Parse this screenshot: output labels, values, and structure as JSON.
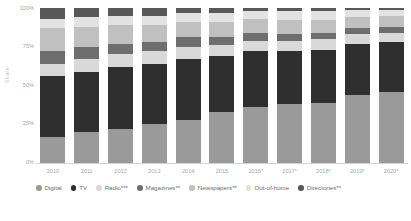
{
  "chart_data": {
    "type": "bar",
    "subtype": "stacked-percentage",
    "title": "",
    "xlabel": "",
    "ylabel": "Share",
    "ylim": [
      0,
      100
    ],
    "ytick_labels": [
      "100%",
      "75%",
      "50%",
      "25%",
      "0%"
    ],
    "ytick_values": [
      100,
      75,
      50,
      25,
      0
    ],
    "grid": false,
    "legend_position": "bottom",
    "categories": [
      "2010",
      "2011",
      "2012",
      "2013",
      "2014",
      "2015",
      "2016*",
      "2017*",
      "2018*",
      "2019*",
      "2020*"
    ],
    "stack_order_bottom_to_top": [
      "Digital",
      "TV",
      "Radio***",
      "Magazines**",
      "Newspapers**",
      "Out-of-home",
      "Directories**"
    ],
    "series": [
      {
        "name": "Digital",
        "color": "#9a9a9a",
        "values": [
          17,
          20,
          22,
          25,
          28,
          33,
          36,
          38,
          39,
          44,
          46
        ]
      },
      {
        "name": "TV",
        "color": "#2f2f2f",
        "values": [
          39,
          39,
          40,
          39,
          39,
          36,
          36,
          34,
          34,
          33,
          32
        ]
      },
      {
        "name": "Radio***",
        "color": "#d9d9d9",
        "values": [
          8,
          8,
          8,
          8,
          8,
          7,
          7,
          7,
          7,
          6,
          6
        ]
      },
      {
        "name": "Magazines**",
        "color": "#6e6e6e",
        "values": [
          8,
          8,
          7,
          6,
          6,
          5,
          5,
          4,
          4,
          4,
          4
        ]
      },
      {
        "name": "Newspapers**",
        "color": "#c0c0c0",
        "values": [
          15,
          13,
          12,
          11,
          10,
          10,
          9,
          9,
          8,
          7,
          7
        ]
      },
      {
        "name": "Out-of-home",
        "color": "#e2e2e2",
        "values": [
          6,
          6,
          6,
          6,
          6,
          6,
          5,
          6,
          6,
          5,
          4
        ]
      },
      {
        "name": "Directories**",
        "color": "#585858",
        "values": [
          7,
          6,
          5,
          5,
          3,
          3,
          2,
          2,
          2,
          1,
          1
        ]
      }
    ]
  },
  "legend": {
    "items": [
      {
        "label": "Digital",
        "color": "#9a9a9a"
      },
      {
        "label": "TV",
        "color": "#2f2f2f"
      },
      {
        "label": "Radio***",
        "color": "#d9d9d9"
      },
      {
        "label": "Magazines**",
        "color": "#6e6e6e"
      },
      {
        "label": "Newspapers**",
        "color": "#c0c0c0"
      },
      {
        "label": "Out-of-home",
        "color": "#e2e2e2"
      },
      {
        "label": "Directories**",
        "color": "#585858"
      }
    ]
  },
  "axes": {
    "y_title": "Share",
    "y_ticks": [
      "100%",
      "75%",
      "50%",
      "25%",
      "0%"
    ],
    "x_ticks": [
      "2010",
      "2011",
      "2012",
      "2013",
      "2014",
      "2015",
      "2016*",
      "2017*",
      "2018*",
      "2019*",
      "2020*"
    ]
  },
  "colors": {
    "background": "#ffffff",
    "axis": "#d2d2d2",
    "tick_text": "#a8a8a8",
    "legend_text": "#6d6d6d"
  }
}
